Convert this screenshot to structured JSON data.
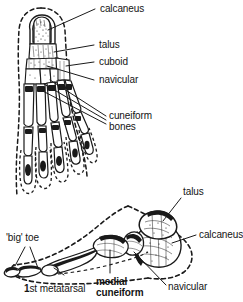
{
  "figure": {
    "ink_color": "#1a1a1a",
    "background_color": "#ffffff",
    "outline_style": "dashed soft-tissue contour",
    "views": [
      {
        "name": "dorsal-view",
        "description": "Top (dorsal) view of right foot skeleton, heel uppermost, toes lowermost"
      },
      {
        "name": "lateral-view",
        "description": "Side (medial/lateral) view of foot skeleton showing arch, heel at right, big toe at left"
      }
    ]
  },
  "labels": {
    "top": {
      "calcaneus": "calcaneus",
      "talus": "talus",
      "cuboid": "cuboid",
      "navicular": "navicular",
      "cuneiform_line1": "cuneiform",
      "cuneiform_line2": "bones"
    },
    "bottom": {
      "talus": "talus",
      "calcaneus": "calcaneus",
      "big_toe": "'big' toe",
      "metatarsal_prefix": "1",
      "metatarsal_rest": "st metatarsal",
      "medial_line1": "medial",
      "medial_line2": "cuneiform",
      "navicular": "navicular"
    }
  }
}
